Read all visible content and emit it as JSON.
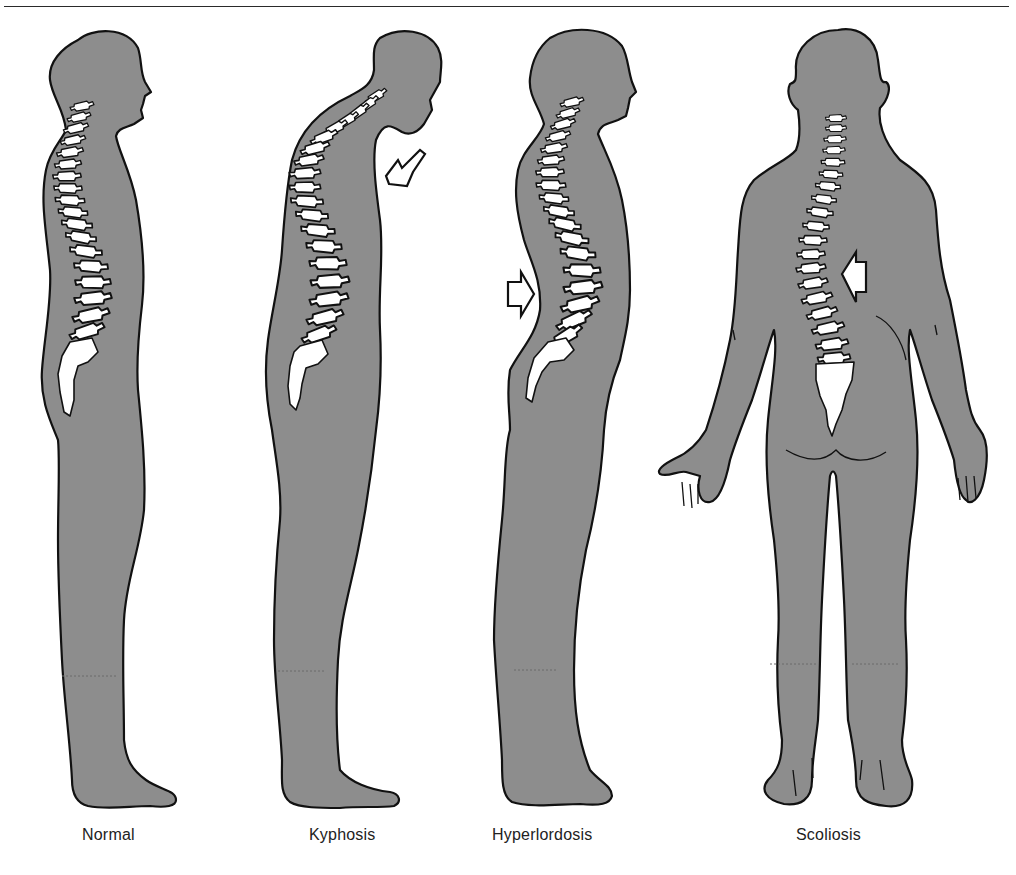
{
  "figure": {
    "colors": {
      "body": "#8d8d8d",
      "outline": "#111111",
      "bone": "#ffffff",
      "background": "#ffffff"
    },
    "panels": [
      {
        "id": "normal",
        "label": "Normal",
        "view": "side",
        "arrow": null
      },
      {
        "id": "kyphosis",
        "label": "Kyphosis",
        "view": "side",
        "arrow": "arrow pointing at upper back / chest (rounded upper spine)"
      },
      {
        "id": "hyperlordosis",
        "label": "Hyperlordosis",
        "view": "side",
        "arrow": "arrow pointing at lower back (excess lumbar curve)"
      },
      {
        "id": "scoliosis",
        "label": "Scoliosis",
        "view": "back",
        "arrow": "arrow pointing at lateral spinal curve"
      }
    ]
  }
}
